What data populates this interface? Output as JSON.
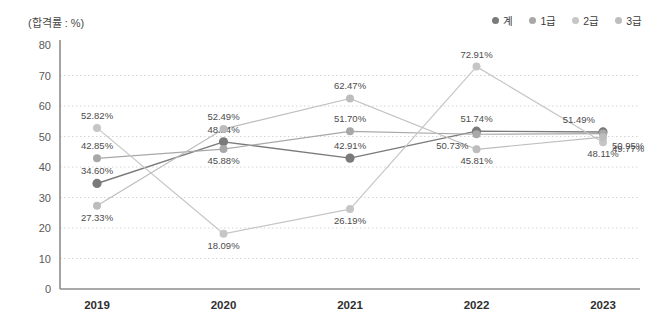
{
  "unit_label": "(합격률 : %)",
  "legend": {
    "position": "top-right",
    "items": [
      {
        "label": "계",
        "color": "#7a7a7a"
      },
      {
        "label": "1급",
        "color": "#a8a8a8"
      },
      {
        "label": "2급",
        "color": "#c6c6c6"
      },
      {
        "label": "3급",
        "color": "#bdbdbd"
      }
    ]
  },
  "chart_data": {
    "type": "line",
    "title": "",
    "subtitle": "",
    "xlabel": "",
    "ylabel": "(합격률 : %)",
    "categories": [
      "2019",
      "2020",
      "2021",
      "2022",
      "2023"
    ],
    "ylim": [
      0,
      80
    ],
    "yticks": [
      0,
      10,
      20,
      30,
      40,
      50,
      60,
      70,
      80
    ],
    "ytick_labels": [
      "0",
      "10",
      "20",
      "30",
      "40",
      "50",
      "60",
      "70",
      "80"
    ],
    "grid": true,
    "legend_position": "top-right",
    "series": [
      {
        "name": "계",
        "color": "#7a7a7a",
        "values": [
          34.6,
          48.24,
          42.91,
          51.74,
          51.49
        ],
        "labels": [
          "34.60%",
          "48.24%",
          "42.91%",
          "51.74%",
          "51.49%"
        ]
      },
      {
        "name": "1급",
        "color": "#a8a8a8",
        "values": [
          42.85,
          45.88,
          51.7,
          50.73,
          50.95
        ],
        "labels": [
          "42.85%",
          "45.88%",
          "51.70%",
          "50.73%",
          "50.95%"
        ]
      },
      {
        "name": "2급",
        "color": "#c6c6c6",
        "values": [
          52.82,
          18.09,
          26.19,
          72.91,
          48.11
        ],
        "labels": [
          "52.82%",
          "18.09%",
          "26.19%",
          "72.91%",
          "48.11%"
        ]
      },
      {
        "name": "3급",
        "color": "#bdbdbd",
        "values": [
          27.33,
          52.49,
          62.47,
          45.81,
          49.77
        ],
        "labels": [
          "27.33%",
          "52.49%",
          "62.47%",
          "45.81%",
          "49.77%"
        ]
      }
    ],
    "label_offsets": [
      [
        [
          0,
          -1
        ],
        [
          0,
          -1
        ],
        [
          0,
          -1
        ],
        [
          0,
          -1
        ],
        [
          -1,
          -1
        ]
      ],
      [
        [
          0,
          -1
        ],
        [
          0,
          1
        ],
        [
          0,
          -1
        ],
        [
          -1,
          0
        ],
        [
          1,
          0
        ]
      ],
      [
        [
          0,
          -1
        ],
        [
          0,
          1
        ],
        [
          0,
          1
        ],
        [
          0,
          -1
        ],
        [
          0,
          1
        ]
      ],
      [
        [
          0,
          1
        ],
        [
          0,
          -1
        ],
        [
          0,
          -1
        ],
        [
          0,
          1
        ],
        [
          1,
          1
        ]
      ]
    ]
  }
}
